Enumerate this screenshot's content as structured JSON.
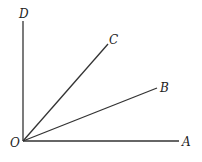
{
  "diagram": {
    "type": "angles-from-common-vertex",
    "vertex": {
      "label": "O",
      "x": 23,
      "y": 141
    },
    "rays": [
      {
        "label": "A",
        "x2": 179,
        "y2": 141
      },
      {
        "label": "B",
        "x2": 157,
        "y2": 88
      },
      {
        "label": "C",
        "x2": 108,
        "y2": 44
      },
      {
        "label": "D",
        "x2": 23,
        "y2": 21
      }
    ],
    "labels": {
      "O": "O",
      "A": "A",
      "B": "B",
      "C": "C",
      "D": "D"
    },
    "colors": {
      "stroke": "#333333",
      "text": "#222222",
      "background": "#ffffff"
    }
  }
}
